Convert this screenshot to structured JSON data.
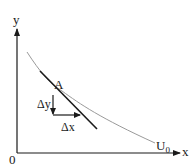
{
  "diagram": {
    "type": "indifference-curve-tangent",
    "axes": {
      "x_label": "x",
      "y_label": "y",
      "origin_label": "0"
    },
    "curve": {
      "label": "U",
      "subscript": "0",
      "color": "#9a9a9a"
    },
    "tangent": {
      "color": "#1a1a1a"
    },
    "point": {
      "label": "A"
    },
    "deltas": {
      "dy_label": "Δy",
      "dx_label": "Δx"
    },
    "colors": {
      "axis": "#1a1a1a",
      "background": "#ffffff"
    }
  }
}
